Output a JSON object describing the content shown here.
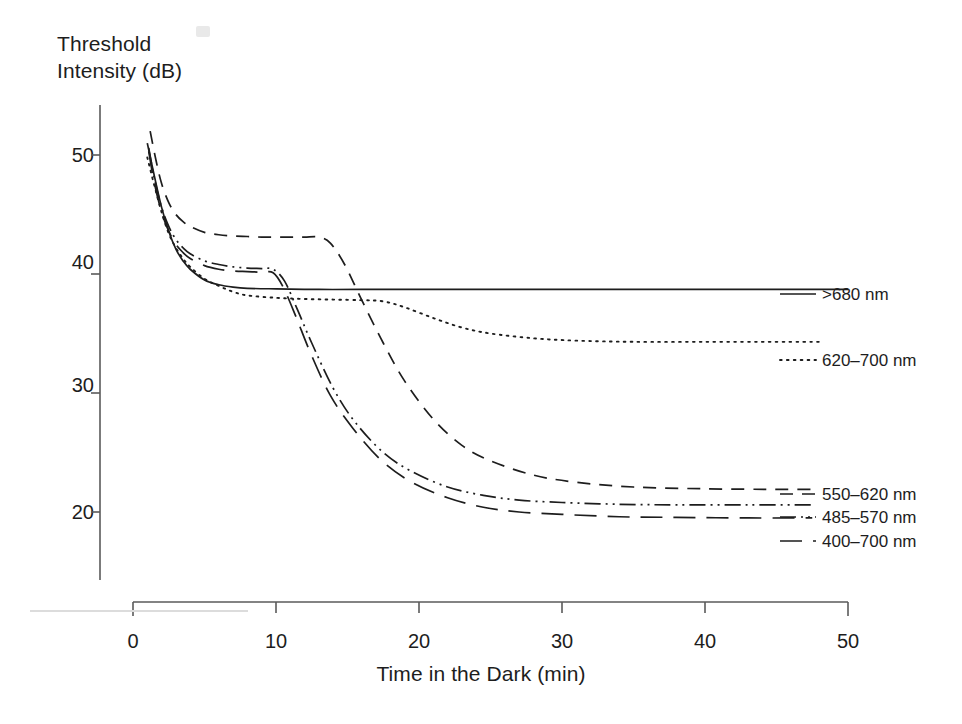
{
  "chart_data": {
    "type": "line",
    "title": "",
    "xlabel": "Time in the Dark (min)",
    "ylabel": "Threshold\nIntensity (dB)",
    "xlim": [
      0,
      50
    ],
    "ylim": [
      15,
      54
    ],
    "xticks": [
      0,
      10,
      20,
      30,
      40,
      50
    ],
    "yticks": [
      20,
      30,
      40,
      50
    ],
    "grid": false,
    "legend_position": "right-inline",
    "series": [
      {
        "name": ">680 nm",
        "style": "solid",
        "x": [
          1.0,
          1.5,
          2.0,
          2.5,
          3.0,
          3.5,
          4.0,
          5.0,
          6.0,
          7.0,
          8.0,
          10.0,
          13.0,
          16.0,
          20.0,
          25.0,
          30.0,
          35.0,
          40.0,
          45.0,
          50.0
        ],
        "y": [
          51.0,
          48.2,
          45.6,
          43.6,
          42.1,
          41.1,
          40.4,
          39.5,
          39.1,
          38.9,
          38.8,
          38.75,
          38.7,
          38.7,
          38.7,
          38.7,
          38.7,
          38.7,
          38.7,
          38.7,
          38.7
        ]
      },
      {
        "name": "620-700 nm",
        "style": "dotted",
        "x": [
          1.0,
          1.5,
          2.0,
          2.5,
          3.0,
          3.5,
          4.0,
          5.0,
          6.0,
          7.0,
          8.0,
          10.0,
          12.0,
          14.0,
          16.0,
          17.5,
          19.0,
          21.0,
          23.0,
          25.0,
          28.0,
          31.0,
          35.0,
          40.0,
          45.0,
          48.0
        ],
        "y": [
          49.8,
          47.4,
          45.2,
          43.4,
          42.2,
          41.3,
          40.6,
          39.6,
          39.0,
          38.5,
          38.2,
          38.0,
          37.9,
          37.85,
          37.8,
          37.7,
          37.2,
          36.3,
          35.5,
          35.0,
          34.6,
          34.4,
          34.3,
          34.3,
          34.3,
          34.3
        ]
      },
      {
        "name": "550-620 nm",
        "style": "dashed",
        "x": [
          1.2,
          1.6,
          2.0,
          2.5,
          3.0,
          3.5,
          4.0,
          5.0,
          6.0,
          7.0,
          8.0,
          9.0,
          10.0,
          11.0,
          12.0,
          13.0,
          13.8,
          14.8,
          16.0,
          17.5,
          19.0,
          21.0,
          23.0,
          25.0,
          28.0,
          31.0,
          35.0,
          40.0,
          45.0,
          47.5
        ],
        "y": [
          52.0,
          49.6,
          47.6,
          46.0,
          45.0,
          44.4,
          44.0,
          43.5,
          43.3,
          43.2,
          43.15,
          43.1,
          43.1,
          43.1,
          43.1,
          43.1,
          42.6,
          40.8,
          37.8,
          34.2,
          31.0,
          27.8,
          25.6,
          24.3,
          23.1,
          22.5,
          22.1,
          21.95,
          21.9,
          21.9
        ]
      },
      {
        "name": "485-570 nm",
        "style": "dashdotdot",
        "x": [
          1.1,
          1.5,
          2.0,
          2.5,
          3.0,
          3.5,
          4.0,
          5.0,
          6.0,
          7.0,
          8.0,
          9.0,
          9.8,
          10.6,
          11.5,
          12.5,
          14.0,
          15.5,
          17.5,
          19.5,
          22.0,
          24.5,
          27.0,
          30.0,
          34.0,
          38.0,
          43.0,
          47.5
        ],
        "y": [
          50.6,
          48.0,
          45.6,
          44.0,
          42.9,
          42.2,
          41.7,
          41.1,
          40.8,
          40.6,
          40.5,
          40.45,
          40.4,
          39.4,
          37.0,
          34.2,
          30.4,
          27.6,
          25.0,
          23.4,
          22.1,
          21.4,
          21.0,
          20.8,
          20.65,
          20.6,
          20.6,
          20.6
        ]
      },
      {
        "name": "400-700 nm",
        "style": "longdash",
        "x": [
          1.1,
          1.5,
          2.0,
          2.5,
          3.0,
          3.5,
          4.0,
          5.0,
          6.0,
          7.0,
          8.0,
          9.0,
          9.8,
          10.5,
          11.4,
          12.4,
          13.8,
          15.4,
          17.4,
          19.5,
          22.0,
          24.5,
          27.0,
          30.0,
          34.0,
          38.0,
          43.0,
          47.5
        ],
        "y": [
          50.3,
          47.6,
          45.2,
          43.6,
          42.5,
          41.8,
          41.3,
          40.7,
          40.4,
          40.25,
          40.2,
          40.15,
          40.1,
          38.9,
          36.4,
          33.4,
          29.8,
          27.0,
          24.3,
          22.5,
          21.2,
          20.4,
          20.0,
          19.8,
          19.6,
          19.55,
          19.5,
          19.5
        ]
      }
    ]
  },
  "axes": {
    "ylabel_text": "Threshold\nIntensity (dB)",
    "xlabel_text": "Time in the Dark (min)",
    "ytick_labels": [
      "50",
      "40",
      "30",
      "20"
    ],
    "xtick_labels": [
      "0",
      "10",
      "20",
      "30",
      "40",
      "50"
    ]
  },
  "legend": {
    "items": [
      {
        "label": ">680 nm",
        "style": "solid"
      },
      {
        "label": "620–700 nm",
        "style": "dotted"
      },
      {
        "label": "550–620 nm",
        "style": "dashed"
      },
      {
        "label": "485–570 nm",
        "style": "dashdotdot"
      },
      {
        "label": "400–700 nm",
        "style": "longdash"
      }
    ]
  },
  "colors": {
    "ink": "#1d1d1d",
    "axis": "#5a5a5a",
    "background": "#ffffff"
  }
}
